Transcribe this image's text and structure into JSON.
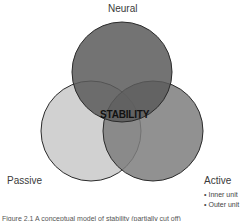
{
  "diagram": {
    "type": "venn",
    "circles": [
      {
        "name": "Neural",
        "cx": 122,
        "cy": 72,
        "r": 50,
        "fill": "#6f6f6f"
      },
      {
        "name": "Passive",
        "cx": 91,
        "cy": 131,
        "r": 50,
        "fill": "#cfcfcf"
      },
      {
        "name": "Active",
        "cx": 153,
        "cy": 131,
        "r": 50,
        "fill": "#8c8c8c"
      }
    ],
    "center_label": "STABILITY",
    "labels": {
      "neural": "Neural",
      "passive": "Passive",
      "active": "Active"
    },
    "active_items": [
      "Inner unit",
      "Outer unit"
    ],
    "caption": "Figure 2.1 A conceptual model of stability (partially cut off)"
  }
}
